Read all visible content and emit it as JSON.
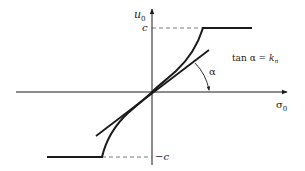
{
  "diagram": {
    "axes": {
      "x_label": "σ",
      "x_sub": "0",
      "y_label": "u",
      "y_sub": "0"
    },
    "levels": {
      "upper": "c",
      "lower": "−c"
    },
    "angle_label": "α",
    "equation": {
      "lhs": "tan α = ",
      "rhs": "k",
      "rhs_sub": "n"
    },
    "colors": {
      "stroke": "#1a1a1a",
      "dashed": "#555555",
      "background": "#ffffff"
    }
  }
}
